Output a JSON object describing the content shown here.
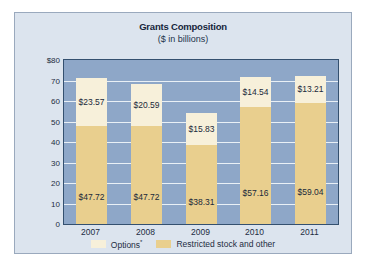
{
  "chart_data": {
    "type": "bar",
    "subtype": "stacked-bar",
    "title": "Grants Composition",
    "subtitle": "($ in billions)",
    "xlabel": "",
    "ylabel": "",
    "categories": [
      "2007",
      "2008",
      "2009",
      "2010",
      "2011"
    ],
    "series": [
      {
        "name": "Restricted stock and other",
        "color": "#e9cf8e",
        "values": [
          47.72,
          47.72,
          38.31,
          57.16,
          59.04
        ],
        "labels": [
          "$47.72",
          "$47.72",
          "$38.31",
          "$57.16",
          "$59.04"
        ]
      },
      {
        "name": "Options*",
        "color": "#f7f0da",
        "values": [
          23.57,
          20.59,
          15.83,
          14.54,
          13.21
        ],
        "labels": [
          "$23.57",
          "$20.59",
          "$15.83",
          "$14.54",
          "$13.21"
        ]
      }
    ],
    "totals": [
      71.29,
      68.31,
      54.14,
      71.7,
      72.25
    ],
    "ylim": [
      0,
      80
    ],
    "ytick_values": [
      0,
      10,
      20,
      30,
      40,
      50,
      60,
      70,
      80
    ],
    "ytick_labels": [
      "0",
      "10",
      "20",
      "30",
      "40",
      "50",
      "60",
      "70",
      "$80"
    ],
    "grid": true,
    "legend_position": "bottom",
    "legend": [
      {
        "label": "Options",
        "superscript": "*",
        "color": "#f7f0da"
      },
      {
        "label": "Restricted stock and other",
        "superscript": "",
        "color": "#e9cf8e"
      }
    ],
    "colors": {
      "plot_background": "#8ea7c8",
      "card_background": "#dce4ee",
      "gridline": "#eef3f9",
      "axis_border": "#34506f",
      "text": "#1d2c41"
    }
  }
}
